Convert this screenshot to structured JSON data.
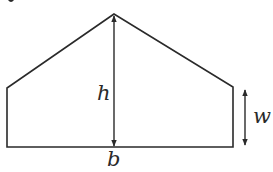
{
  "diagram": {
    "labels": {
      "height": "h",
      "wall": "w",
      "base": "b"
    },
    "colors": {
      "stroke": "#2a2a2a",
      "background": "#ffffff"
    },
    "shape": {
      "apex": [
        114,
        14
      ],
      "left_top": [
        7,
        88
      ],
      "left_bottom": [
        7,
        147
      ],
      "right_bottom": [
        233,
        147
      ],
      "right_top": [
        233,
        87
      ]
    },
    "dimensions": {
      "h_arrow": {
        "x": 114,
        "y1": 14,
        "y2": 147
      },
      "w_arrow": {
        "x": 245,
        "y1": 90,
        "y2": 145
      }
    }
  }
}
